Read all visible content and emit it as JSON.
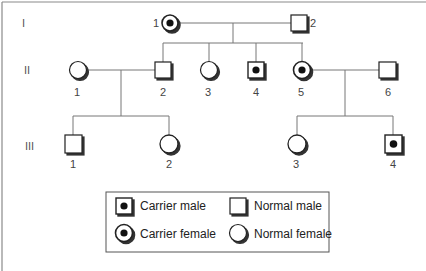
{
  "diagram": {
    "type": "pedigree",
    "colors": {
      "frame": "#8a8a8a",
      "line": "#777777",
      "symbol_stroke": "#222222",
      "shadow": "#333333",
      "carrier_dot": "#111111",
      "background": "#ffffff"
    },
    "generations": [
      {
        "label": "I"
      },
      {
        "label": "II"
      },
      {
        "label": "III"
      }
    ],
    "individuals": {
      "I": [
        {
          "id": "1",
          "sex": "female",
          "status": "carrier"
        },
        {
          "id": "2",
          "sex": "male",
          "status": "normal"
        }
      ],
      "II": [
        {
          "id": "1",
          "sex": "female",
          "status": "normal"
        },
        {
          "id": "2",
          "sex": "male",
          "status": "normal"
        },
        {
          "id": "3",
          "sex": "female",
          "status": "normal"
        },
        {
          "id": "4",
          "sex": "male",
          "status": "carrier"
        },
        {
          "id": "5",
          "sex": "female",
          "status": "carrier"
        },
        {
          "id": "6",
          "sex": "male",
          "status": "normal"
        }
      ],
      "III": [
        {
          "id": "1",
          "sex": "male",
          "status": "normal"
        },
        {
          "id": "2",
          "sex": "female",
          "status": "normal"
        },
        {
          "id": "3",
          "sex": "female",
          "status": "normal"
        },
        {
          "id": "4",
          "sex": "male",
          "status": "carrier"
        }
      ]
    },
    "legend": {
      "carrier_male": "Carrier male",
      "normal_male": "Normal male",
      "carrier_female": "Carrier female",
      "normal_female": "Normal female"
    }
  }
}
